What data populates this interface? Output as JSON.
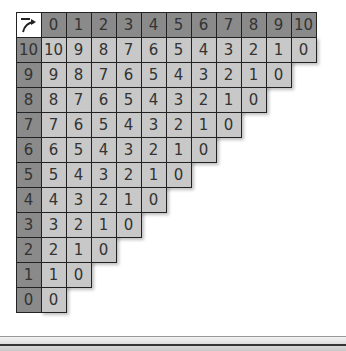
{
  "corner_icon": "subtract-arrow-icon",
  "column_headers": [
    "0",
    "1",
    "2",
    "3",
    "4",
    "5",
    "6",
    "7",
    "8",
    "9",
    "10"
  ],
  "row_headers": [
    "10",
    "9",
    "8",
    "7",
    "6",
    "5",
    "4",
    "3",
    "2",
    "1",
    "0"
  ],
  "rows": [
    [
      "10",
      "9",
      "8",
      "7",
      "6",
      "5",
      "4",
      "3",
      "2",
      "1",
      "0"
    ],
    [
      "9",
      "8",
      "7",
      "6",
      "5",
      "4",
      "3",
      "2",
      "1",
      "0"
    ],
    [
      "8",
      "7",
      "6",
      "5",
      "4",
      "3",
      "2",
      "1",
      "0"
    ],
    [
      "7",
      "6",
      "5",
      "4",
      "3",
      "2",
      "1",
      "0"
    ],
    [
      "6",
      "5",
      "4",
      "3",
      "2",
      "1",
      "0"
    ],
    [
      "5",
      "4",
      "3",
      "2",
      "1",
      "0"
    ],
    [
      "4",
      "3",
      "2",
      "1",
      "0"
    ],
    [
      "3",
      "2",
      "1",
      "0"
    ],
    [
      "2",
      "1",
      "0"
    ],
    [
      "1",
      "0"
    ],
    [
      "0"
    ]
  ],
  "colors": {
    "header": "#8a8a8a",
    "body": "#c8c8c8",
    "corner": "#ffffff",
    "border": "#222222"
  }
}
